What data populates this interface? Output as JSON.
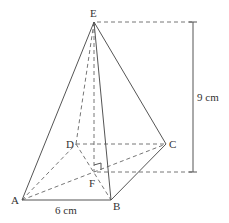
{
  "diagram": {
    "type": "square-based pyramid",
    "vertices": {
      "A": {
        "label": "A",
        "x": 22,
        "y": 200
      },
      "B": {
        "label": "B",
        "x": 111,
        "y": 200
      },
      "C": {
        "label": "C",
        "x": 166,
        "y": 144
      },
      "D": {
        "label": "D",
        "x": 76,
        "y": 144
      },
      "E": {
        "label": "E",
        "x": 94,
        "y": 22
      },
      "F": {
        "label": "F",
        "x": 94,
        "y": 172
      }
    },
    "dimensions": {
      "base_edge": "6 cm",
      "height": "9 cm"
    },
    "annotations": {
      "right_angle_at": "F"
    }
  }
}
